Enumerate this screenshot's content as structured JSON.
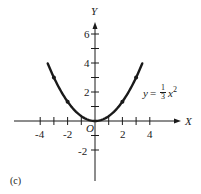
{
  "chart_data": {
    "type": "line",
    "title": "",
    "panel_label": "(c)",
    "equation": {
      "lhs": "y",
      "equals": "=",
      "frac_num": "1",
      "frac_den": "3",
      "var": "x",
      "exp": "2"
    },
    "xlabel": "X",
    "ylabel": "Y",
    "origin_label": "O",
    "xlim": [
      -5.5,
      5.5
    ],
    "ylim": [
      -3,
      7
    ],
    "x_ticks": [
      -4,
      -3,
      -2,
      -1,
      1,
      2,
      3,
      4
    ],
    "x_tick_labels": [
      "-4",
      "-2",
      "2",
      "4"
    ],
    "y_ticks": [
      -2,
      -1,
      1,
      2,
      3,
      4,
      5,
      6
    ],
    "y_tick_labels": [
      "6",
      "4",
      "2",
      "-2"
    ],
    "grid": false,
    "series": [
      {
        "name": "y = (1/3) x^2",
        "function": "x^2/3",
        "x_range": [
          -3.45,
          3.45
        ],
        "marked_points": [
          {
            "x": -3,
            "y": 3
          },
          {
            "x": -2,
            "y": 1.33
          },
          {
            "x": 0,
            "y": 0
          },
          {
            "x": 2,
            "y": 1.33
          },
          {
            "x": 3,
            "y": 3
          }
        ]
      }
    ],
    "color": "#1a1a1a"
  }
}
